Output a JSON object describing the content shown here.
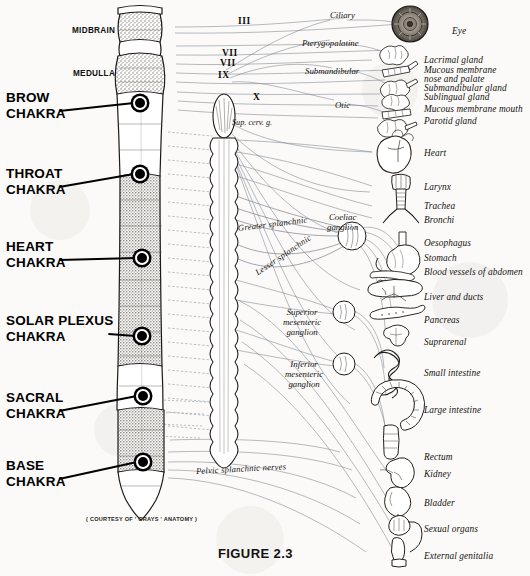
{
  "figure": {
    "caption": "FIGURE 2.3",
    "courtesy": "( COURTESY OF ' GRAYS ' ANATOMY )"
  },
  "brain_regions": [
    {
      "label": "MIDBRAIN",
      "x": 72,
      "y": 26
    },
    {
      "label": "MEDULLA",
      "x": 73,
      "y": 69
    }
  ],
  "chakras": [
    {
      "name": "BROW CHAKRA",
      "line1": "BROW",
      "line2": "CHAKRA",
      "x": 6,
      "y": 90,
      "node_x": 140,
      "node_y": 103,
      "leader_y": 110
    },
    {
      "name": "THROAT CHAKRA",
      "line1": "THROAT",
      "line2": "CHAKRA",
      "x": 6,
      "y": 166,
      "node_x": 140,
      "node_y": 174,
      "leader_y": 186
    },
    {
      "name": "HEART CHAKRA",
      "line1": "HEART",
      "line2": "CHAKRA",
      "x": 6,
      "y": 239,
      "node_x": 142,
      "node_y": 258,
      "leader_y": 259
    },
    {
      "name": "SOLAR PLEXUS CHAKRA",
      "line1": "SOLAR PLEXUS",
      "line2": "CHAKRA",
      "x": 6,
      "y": 313,
      "node_x": 142,
      "node_y": 336,
      "leader_y": 336
    },
    {
      "name": "SACRAL CHAKRA",
      "line1": "SACRAL",
      "line2": "CHAKRA",
      "x": 6,
      "y": 390,
      "node_x": 143,
      "node_y": 396,
      "leader_y": 410
    },
    {
      "name": "BASE CHAKRA",
      "line1": "BASE",
      "line2": "CHAKRA",
      "x": 6,
      "y": 458,
      "node_x": 143,
      "node_y": 462,
      "leader_y": 478
    }
  ],
  "cranial_nerves": [
    {
      "label": "III",
      "x": 238,
      "y": 16
    },
    {
      "label": "VII",
      "x": 222,
      "y": 48
    },
    {
      "label": "VII",
      "x": 220,
      "y": 58
    },
    {
      "label": "IX",
      "x": 218,
      "y": 70
    },
    {
      "label": "X",
      "x": 253,
      "y": 92
    }
  ],
  "sup_cervical_ganglion": {
    "label": "Sup. cerv. g.",
    "x": 232,
    "y": 118
  },
  "parasympathetic_ganglia": [
    {
      "label": "Ciliary",
      "x": 330,
      "y": 10
    },
    {
      "label": "Pterygopalatine",
      "x": 302,
      "y": 38
    },
    {
      "label": "Submandibular",
      "x": 305,
      "y": 66
    },
    {
      "label": "Otic",
      "x": 335,
      "y": 100
    }
  ],
  "splanchnic_nerves": [
    {
      "label": "Greater splanchnic",
      "x": 238,
      "y": 223,
      "rotate": -7,
      "class": "splanch"
    },
    {
      "label": "Lesser splanchnic",
      "x": 256,
      "y": 268,
      "rotate": -34,
      "class": "splanch"
    },
    {
      "label": "Pelvic splanchnic nerves",
      "x": 196,
      "y": 466,
      "rotate": -3,
      "class": "splanch"
    }
  ],
  "prevertebral_ganglia": [
    {
      "lines": [
        "Coeliac",
        "ganglion"
      ],
      "x": 327,
      "y": 212
    },
    {
      "lines": [
        "Superior",
        "mesenteric",
        "ganglion"
      ],
      "x": 283,
      "y": 307
    },
    {
      "lines": [
        "Inferior",
        "mesenteric",
        "ganglion"
      ],
      "x": 285,
      "y": 359
    }
  ],
  "organs": [
    {
      "label": "Eye",
      "x": 452,
      "y": 26,
      "icon": "eye-icon"
    },
    {
      "label": "Lacrimal gland",
      "x": 424,
      "y": 55,
      "icon": "lacrimal-gland-icon"
    },
    {
      "label": "Mucous membrane",
      "x": 424,
      "y": 65,
      "icon": "mucous-membrane-nose-icon"
    },
    {
      "label": "nose and palate",
      "x": 424,
      "y": 74,
      "icon": null
    },
    {
      "label": "Submandibular gland",
      "x": 424,
      "y": 83,
      "icon": "submandibular-gland-icon"
    },
    {
      "label": "Sublingual gland",
      "x": 424,
      "y": 92,
      "icon": "sublingual-gland-icon"
    },
    {
      "label": "Mucous membrane mouth",
      "x": 424,
      "y": 104,
      "icon": "mucous-membrane-mouth-icon"
    },
    {
      "label": "Parotid gland",
      "x": 424,
      "y": 116,
      "icon": "parotid-gland-icon"
    },
    {
      "label": "Heart",
      "x": 424,
      "y": 148,
      "icon": "heart-icon"
    },
    {
      "label": "Larynx",
      "x": 424,
      "y": 182,
      "icon": "larynx-icon"
    },
    {
      "label": "Trachea",
      "x": 424,
      "y": 201,
      "icon": "trachea-icon"
    },
    {
      "label": "Bronchi",
      "x": 424,
      "y": 215,
      "icon": "bronchi-icon"
    },
    {
      "label": "Oesophagus",
      "x": 424,
      "y": 238,
      "icon": "oesophagus-icon"
    },
    {
      "label": "Stomach",
      "x": 424,
      "y": 253,
      "icon": "stomach-icon"
    },
    {
      "label": "Blood vessels of abdomen",
      "x": 424,
      "y": 267,
      "icon": "blood-vessels-icon"
    },
    {
      "label": "Liver and ducts",
      "x": 424,
      "y": 292,
      "icon": "liver-icon"
    },
    {
      "label": "Pancreas",
      "x": 424,
      "y": 315,
      "icon": "pancreas-icon"
    },
    {
      "label": "Suprarenal",
      "x": 424,
      "y": 337,
      "icon": "suprarenal-icon"
    },
    {
      "label": "Small intestine",
      "x": 424,
      "y": 368,
      "icon": "small-intestine-icon"
    },
    {
      "label": "Large intestine",
      "x": 424,
      "y": 405,
      "icon": "large-intestine-icon"
    },
    {
      "label": "Rectum",
      "x": 424,
      "y": 452,
      "icon": "rectum-icon"
    },
    {
      "label": "Kidney",
      "x": 424,
      "y": 469,
      "icon": "kidney-icon"
    },
    {
      "label": "Bladder",
      "x": 424,
      "y": 498,
      "icon": "bladder-icon"
    },
    {
      "label": "Sexual organs",
      "x": 424,
      "y": 524,
      "icon": "sexual-organs-icon"
    },
    {
      "label": "External genitalia",
      "x": 424,
      "y": 551,
      "icon": "external-genitalia-icon"
    }
  ],
  "colors": {
    "ink": "#15120f",
    "nerve_line": "#6d7685",
    "leader": "#000000",
    "shade": "#9a948c",
    "paper": "#fbfaf8"
  }
}
